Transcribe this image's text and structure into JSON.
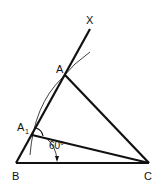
{
  "diagram": {
    "type": "geometric-construction",
    "points": {
      "X": {
        "label": "X",
        "x": 90,
        "y": 28
      },
      "A": {
        "label": "A",
        "x": 65,
        "y": 75
      },
      "A1": {
        "label": "A",
        "sub": "1",
        "x": 32,
        "y": 133
      },
      "B": {
        "label": "B",
        "x": 16,
        "y": 163
      },
      "C": {
        "label": "C",
        "x": 148,
        "y": 163
      }
    },
    "angle_label": "60°",
    "colors": {
      "stroke": "#111111",
      "background": "#ffffff"
    }
  }
}
